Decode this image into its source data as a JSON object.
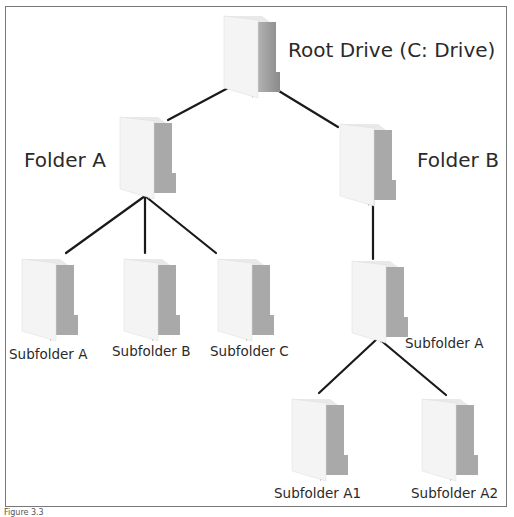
{
  "diagram": {
    "caption": "Figure 3.3",
    "nodes": [
      {
        "id": "root",
        "label": "Root Drive (C: Drive)",
        "parent": null
      },
      {
        "id": "folderA",
        "label": "Folder A",
        "parent": "root"
      },
      {
        "id": "folderB",
        "label": "Folder B",
        "parent": "root"
      },
      {
        "id": "subA",
        "label": "Subfolder A",
        "parent": "folderA"
      },
      {
        "id": "subB",
        "label": "Subfolder B",
        "parent": "folderA"
      },
      {
        "id": "subC",
        "label": "Subfolder C",
        "parent": "folderA"
      },
      {
        "id": "bSubA",
        "label": "Subfolder A",
        "parent": "folderB"
      },
      {
        "id": "subA1",
        "label": "Subfolder A1",
        "parent": "bSubA"
      },
      {
        "id": "subA2",
        "label": "Subfolder A2",
        "parent": "bSubA"
      }
    ],
    "icon": "folder-icon",
    "colors": {
      "line": "#1a1a1a",
      "border": "#777777",
      "folder_light": "#efefef",
      "folder_dark": "#a8a8a8"
    }
  }
}
